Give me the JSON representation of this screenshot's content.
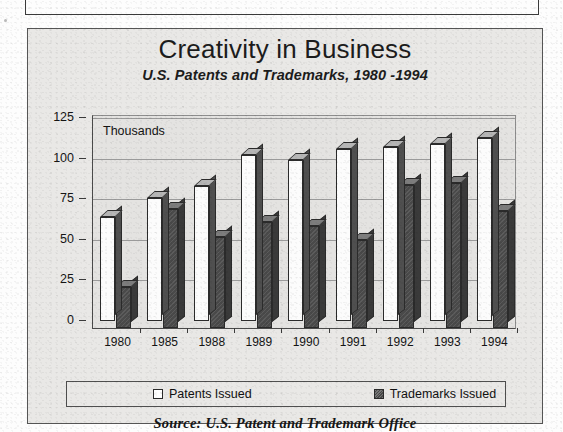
{
  "page": {
    "background_color": "#fdfdfd",
    "frame_color": "#555555",
    "panel_color": "#e9e8e6"
  },
  "chart_panel": {
    "title": "Creativity in Business",
    "subtitle": "U.S. Patents and Trademarks, 1980 -1994",
    "unit_note": "Thousands",
    "source_note": "Source:  U.S. Patent and Trademark Office"
  },
  "legend": {
    "items": [
      {
        "label": "Patents Issued",
        "swatch": "white-square-icon",
        "color": "#ffffff"
      },
      {
        "label": "Trademarks Issued",
        "swatch": "hatched-square-icon",
        "color": "#4a4a4a"
      }
    ]
  },
  "chart_data": {
    "type": "bar",
    "title": "Creativity in Business",
    "subtitle": "U.S. Patents and Trademarks, 1980 -1994",
    "xlabel": "",
    "ylabel": "Thousands",
    "ylim": [
      0,
      125
    ],
    "yticks": [
      0,
      25,
      50,
      75,
      100,
      125
    ],
    "grid": true,
    "legend_position": "bottom",
    "style": "3d-clustered-column",
    "categories": [
      "1980",
      "1985",
      "1988",
      "1989",
      "1990",
      "1991",
      "1992",
      "1993",
      "1994"
    ],
    "series": [
      {
        "name": "Patents Issued",
        "color": "#ffffff",
        "values": [
          64,
          76,
          83,
          102,
          99,
          106,
          107,
          109,
          113
        ]
      },
      {
        "name": "Trademarks Issued",
        "color": "#4a4a4a",
        "values": [
          25,
          73,
          56,
          65,
          63,
          54,
          88,
          89,
          72
        ]
      }
    ]
  }
}
